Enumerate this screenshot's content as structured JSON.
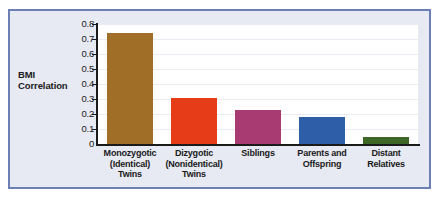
{
  "figure": {
    "frame_border_color": "#6d80b4",
    "frame_background_color": "#e7e9f3",
    "plot_background_color": "#ffffff"
  },
  "chart_data": {
    "type": "bar",
    "title": "",
    "subtitle": "",
    "xlabel": "",
    "ylabel": "BMI Correlation",
    "ylim": [
      0,
      0.8
    ],
    "grid": true,
    "legend": "none",
    "ytick_labels": [
      "0.8",
      "0.7",
      "0.6",
      "0.5",
      "0.4",
      "0.3",
      "0.2",
      "0.1",
      "0"
    ],
    "ytick_values": [
      0.8,
      0.7,
      0.6,
      0.5,
      0.4,
      0.3,
      0.2,
      0.1,
      0
    ],
    "categories": [
      "Monozygotic\n(Identical)\nTwins",
      "Dizygotic\n(Nonidentical)\nTwins",
      "Siblings",
      "Parents and\nOffspring",
      "Distant\nRelatives"
    ],
    "category_lines": [
      [
        "Monozygotic",
        "(Identical)",
        "Twins"
      ],
      [
        "Dizygotic",
        "(Nonidentical)",
        "Twins"
      ],
      [
        "Siblings"
      ],
      [
        "Parents and",
        "Offspring"
      ],
      [
        "Distant",
        "Relatives"
      ]
    ],
    "values": [
      0.74,
      0.31,
      0.23,
      0.18,
      0.05
    ],
    "colors": [
      "#a06e26",
      "#e63d18",
      "#a83b72",
      "#2f5ea8",
      "#3d6627"
    ],
    "bar_edge_color": "#000000"
  }
}
